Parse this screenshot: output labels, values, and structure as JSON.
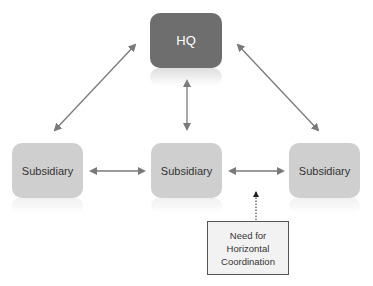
{
  "diagram": {
    "nodes": {
      "hq": {
        "label": "HQ"
      },
      "subsidiary_left": {
        "label": "Subsidiary"
      },
      "subsidiary_middle": {
        "label": "Subsidiary"
      },
      "subsidiary_right": {
        "label": "Subsidiary"
      }
    },
    "callout": {
      "line1": "Need for",
      "line2": "Horizontal",
      "line3": "Coordination"
    },
    "edges": [
      {
        "from": "hq",
        "to": "subsidiary_left",
        "style": "bidirectional-solid"
      },
      {
        "from": "hq",
        "to": "subsidiary_middle",
        "style": "bidirectional-solid"
      },
      {
        "from": "hq",
        "to": "subsidiary_right",
        "style": "bidirectional-solid"
      },
      {
        "from": "subsidiary_left",
        "to": "subsidiary_middle",
        "style": "bidirectional-solid"
      },
      {
        "from": "subsidiary_middle",
        "to": "subsidiary_right",
        "style": "bidirectional-solid"
      },
      {
        "from": "callout",
        "to": "edge:subsidiary_middle-subsidiary_right",
        "style": "dotted-arrow"
      }
    ],
    "colors": {
      "hq_fill": "#6e6e6e",
      "subsidiary_fill": "#cfcfcf",
      "arrow": "#7a7a7a",
      "callout_fill": "#f2f2f2"
    }
  }
}
